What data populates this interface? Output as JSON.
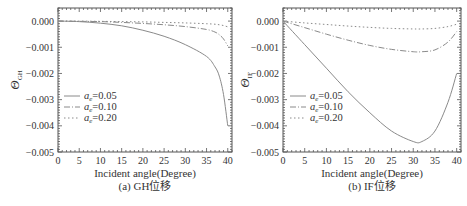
{
  "chart_data": [
    {
      "type": "line",
      "id": "a",
      "caption": "(a) GH位移",
      "xlabel": "Incident angle(Degree)",
      "ylabel": "Θ",
      "ylabel_sub": "GH",
      "xlim": [
        0,
        41
      ],
      "ylim": [
        -0.005,
        0.0005
      ],
      "xticks": [
        0,
        5,
        10,
        15,
        20,
        25,
        30,
        35,
        40
      ],
      "yticks": [
        0.0,
        -0.001,
        -0.002,
        -0.003,
        -0.004,
        -0.005
      ],
      "ytick_labels": [
        "0.000",
        "−0.001",
        "−0.002",
        "−0.003",
        "−0.004",
        "−0.005"
      ],
      "legend_position": "lower left",
      "x": [
        0,
        5,
        10,
        15,
        20,
        25,
        30,
        35,
        37,
        38,
        39,
        40
      ],
      "series": [
        {
          "name": "a_e=0.05",
          "style": "solid",
          "values": [
            0.0,
            -2e-05,
            -8e-05,
            -0.00018,
            -0.00035,
            -0.00058,
            -0.0009,
            -0.00135,
            -0.00175,
            -0.0021,
            -0.0028,
            -0.004
          ]
        },
        {
          "name": "a_e=0.10",
          "style": "dashdot",
          "values": [
            0.0,
            -1e-05,
            -2e-05,
            -5e-05,
            -9e-05,
            -0.00014,
            -0.00021,
            -0.00032,
            -0.00042,
            -0.00052,
            -0.00068,
            -0.00095
          ]
        },
        {
          "name": "a_e=0.20",
          "style": "dotted",
          "values": [
            0.0,
            0.0,
            -1e-05,
            -2e-05,
            -3e-05,
            -5e-05,
            -7e-05,
            -0.0001,
            -0.00012,
            -0.00014,
            -0.00017,
            -0.00022
          ]
        }
      ]
    },
    {
      "type": "line",
      "id": "b",
      "caption": "(b) IF位移",
      "xlabel": "Incident angle(Degree)",
      "ylabel": "Θ",
      "ylabel_sub": "IF",
      "xlim": [
        0,
        41
      ],
      "ylim": [
        -0.005,
        0.0005
      ],
      "xticks": [
        0,
        5,
        10,
        15,
        20,
        25,
        30,
        35,
        40
      ],
      "yticks": [
        0.0,
        -0.001,
        -0.002,
        -0.003,
        -0.004,
        -0.005
      ],
      "ytick_labels": [
        "0.000",
        "−0.001",
        "−0.002",
        "−0.003",
        "−0.004",
        "−0.005"
      ],
      "legend_position": "lower left",
      "x": [
        0,
        5,
        10,
        15,
        20,
        25,
        30,
        32,
        35,
        38,
        40
      ],
      "series": [
        {
          "name": "a_e=0.05",
          "style": "solid",
          "values": [
            0.0,
            -0.0009,
            -0.0018,
            -0.0027,
            -0.0035,
            -0.0042,
            -0.0046,
            -0.0046,
            -0.0042,
            -0.0031,
            -0.002
          ]
        },
        {
          "name": "a_e=0.10",
          "style": "dashdot",
          "values": [
            0.0,
            -0.00025,
            -0.0005,
            -0.00073,
            -0.00093,
            -0.00108,
            -0.00117,
            -0.00117,
            -0.0011,
            -0.0008,
            -0.0004
          ]
        },
        {
          "name": "a_e=0.20",
          "style": "dotted",
          "values": [
            0.0,
            -7e-05,
            -0.00013,
            -0.00019,
            -0.00024,
            -0.00028,
            -0.0003,
            -0.0003,
            -0.00028,
            -0.00021,
            -0.00012
          ]
        }
      ]
    }
  ],
  "legend": {
    "items": [
      {
        "label_main": "a",
        "label_sub": "e",
        "label_value": "=0.05"
      },
      {
        "label_main": "a",
        "label_sub": "e",
        "label_value": "=0.10"
      },
      {
        "label_main": "a",
        "label_sub": "e",
        "label_value": "=0.20"
      }
    ]
  },
  "colors": {
    "solid": "#8a8a8a",
    "dashdot": "#8a8a8a",
    "dotted": "#8a8a8a",
    "frame": "#555555",
    "text": "#333333"
  }
}
